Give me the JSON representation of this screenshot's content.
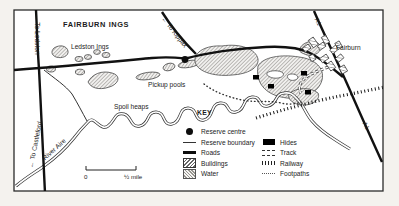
{
  "map": {
    "title": "FAIRBURN INGS",
    "labels": {
      "ledston_ings": "Ledston Ings",
      "pickup_pools": "Pickup pools",
      "spoil_heaps": "Spoil heaps",
      "fairburn": "Fairburn",
      "river_aire": "River Aire"
    },
    "road_labels": {
      "to_ledston": "← To Ledston",
      "to_kippax": "← To Kippax",
      "to_castleford": "← To Castleford",
      "a1_top": "A1",
      "a1_bottom": "A1"
    },
    "scale": {
      "start": "0",
      "end": "½ mile"
    }
  },
  "legend": {
    "title": "KEY",
    "col1": [
      {
        "symbol": "reserve-centre",
        "label": "Reserve centre"
      },
      {
        "symbol": "reserve-boundary",
        "label": "Reserve boundary"
      },
      {
        "symbol": "roads",
        "label": "Roads"
      },
      {
        "symbol": "buildings",
        "label": "Buildings"
      },
      {
        "symbol": "water",
        "label": "Water"
      }
    ],
    "col2": [
      {
        "symbol": "hides",
        "label": "Hides"
      },
      {
        "symbol": "track",
        "label": "Track"
      },
      {
        "symbol": "railway",
        "label": "Railway"
      },
      {
        "symbol": "footpaths",
        "label": "Footpaths"
      }
    ]
  },
  "colors": {
    "ink": "#1c1c1c",
    "paper": "#ffffff",
    "outer_bg": "#f4f2ee"
  }
}
